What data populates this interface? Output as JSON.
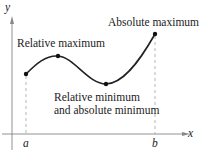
{
  "diagram": {
    "axes": {
      "x_label": "x",
      "y_label": "y"
    },
    "interval": {
      "left": "a",
      "right": "b"
    },
    "annotations": {
      "relative_maximum": "Relative maximum",
      "absolute_maximum": "Absolute maximum",
      "minimum_line1": "Relative minimum",
      "minimum_line2": "and absolute minimum"
    },
    "colors": {
      "curve": "#222222",
      "axis": "#666666",
      "dashed": "#888888"
    }
  }
}
